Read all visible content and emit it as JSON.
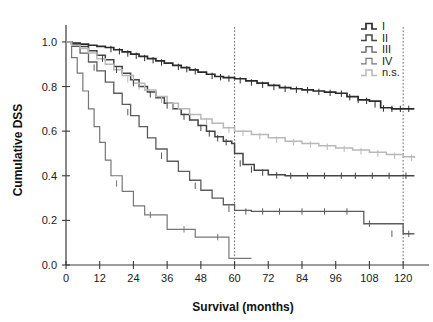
{
  "chart_data": {
    "type": "line",
    "title": "",
    "xlabel": "Survival (months)",
    "ylabel": "Cumulative DSS",
    "xlim": [
      0,
      126
    ],
    "ylim": [
      0.0,
      1.04
    ],
    "xticks": [
      0,
      12,
      24,
      36,
      48,
      60,
      72,
      84,
      96,
      108,
      120
    ],
    "xtick_labels": [
      "0",
      "12",
      "24",
      "36",
      "48",
      "60",
      "72",
      "84",
      "96",
      "108",
      "120"
    ],
    "yticks": [
      0.0,
      0.2,
      0.4,
      0.6,
      0.8,
      1.0
    ],
    "ytick_labels": [
      "0.0",
      "0.2",
      "0.4",
      "0.6",
      "0.8",
      "1.0"
    ],
    "grid": false,
    "legend_position": "top-right",
    "reference_lines": [
      {
        "name": "vline-60",
        "orientation": "vertical",
        "x": 60,
        "style": "dotted"
      },
      {
        "name": "vline-120",
        "orientation": "vertical",
        "x": 120,
        "style": "dotted"
      }
    ],
    "series": [
      {
        "name": "I",
        "label": "I",
        "color": "#2a2a2a",
        "width": 1.7,
        "final_value": 0.7,
        "x": [
          0,
          2,
          5,
          8,
          11,
          14,
          17,
          20,
          23,
          26,
          29,
          32,
          35,
          38,
          41,
          44,
          47,
          50,
          53,
          56,
          60,
          64,
          68,
          72,
          76,
          80,
          84,
          88,
          92,
          96,
          100,
          104,
          108,
          112,
          116,
          120,
          124
        ],
        "y": [
          1.0,
          0.995,
          0.99,
          0.985,
          0.98,
          0.975,
          0.965,
          0.955,
          0.945,
          0.935,
          0.925,
          0.915,
          0.905,
          0.895,
          0.885,
          0.875,
          0.865,
          0.855,
          0.845,
          0.84,
          0.835,
          0.825,
          0.815,
          0.805,
          0.795,
          0.79,
          0.785,
          0.78,
          0.775,
          0.77,
          0.755,
          0.74,
          0.735,
          0.705,
          0.7,
          0.7,
          0.7
        ],
        "censor_x": [
          16,
          19,
          22,
          25,
          28,
          31,
          34,
          40,
          43,
          46,
          52,
          55,
          58,
          62,
          66,
          70,
          74,
          78,
          82,
          86,
          90,
          94,
          98,
          101,
          104,
          107,
          110,
          113,
          116,
          119,
          122
        ],
        "censor_y": [
          0.968,
          0.958,
          0.948,
          0.938,
          0.928,
          0.918,
          0.908,
          0.888,
          0.878,
          0.868,
          0.848,
          0.842,
          0.836,
          0.828,
          0.818,
          0.808,
          0.798,
          0.79,
          0.786,
          0.784,
          0.776,
          0.772,
          0.768,
          0.752,
          0.74,
          0.736,
          0.72,
          0.702,
          0.7,
          0.7,
          0.7
        ]
      },
      {
        "name": "II",
        "label": "II",
        "color": "#444444",
        "width": 1.5,
        "final_value": 0.4,
        "x": [
          0,
          2,
          5,
          8,
          11,
          14,
          17,
          20,
          23,
          26,
          29,
          32,
          35,
          38,
          41,
          44,
          47,
          50,
          53,
          56,
          59,
          60,
          63,
          67,
          72,
          78,
          84,
          90,
          96,
          102,
          108,
          114,
          120,
          124
        ],
        "y": [
          1.0,
          0.99,
          0.98,
          0.96,
          0.94,
          0.92,
          0.89,
          0.86,
          0.83,
          0.8,
          0.775,
          0.75,
          0.725,
          0.7,
          0.675,
          0.65,
          0.625,
          0.6,
          0.575,
          0.555,
          0.545,
          0.5,
          0.45,
          0.425,
          0.405,
          0.4,
          0.4,
          0.4,
          0.4,
          0.4,
          0.4,
          0.4,
          0.4,
          0.4
        ],
        "censor_x": [
          13,
          18,
          24,
          30,
          36,
          42,
          48,
          51,
          54,
          57,
          62,
          66,
          70,
          75,
          80,
          86,
          92,
          98,
          103,
          109,
          115,
          121
        ],
        "censor_y": [
          0.925,
          0.875,
          0.815,
          0.765,
          0.715,
          0.665,
          0.615,
          0.59,
          0.568,
          0.551,
          0.455,
          0.428,
          0.414,
          0.402,
          0.4,
          0.4,
          0.4,
          0.4,
          0.4,
          0.4,
          0.4,
          0.4
        ]
      },
      {
        "name": "III",
        "label": "III",
        "color": "#5c5c5c",
        "width": 1.3,
        "final_value": 0.14,
        "x": [
          0,
          2,
          5,
          8,
          11,
          14,
          17,
          20,
          23,
          26,
          29,
          32,
          36,
          40,
          44,
          48,
          52,
          56,
          60,
          66,
          72,
          80,
          88,
          96,
          104,
          106,
          112,
          120,
          124
        ],
        "y": [
          1.0,
          0.98,
          0.95,
          0.91,
          0.87,
          0.82,
          0.77,
          0.72,
          0.67,
          0.62,
          0.57,
          0.52,
          0.465,
          0.42,
          0.38,
          0.335,
          0.3,
          0.27,
          0.245,
          0.24,
          0.24,
          0.24,
          0.24,
          0.24,
          0.24,
          0.185,
          0.185,
          0.14,
          0.14
        ],
        "censor_x": [
          10,
          22,
          34,
          46,
          58,
          64,
          70,
          76,
          84,
          92,
          100,
          108,
          116,
          122
        ],
        "censor_y": [
          0.885,
          0.685,
          0.49,
          0.355,
          0.252,
          0.24,
          0.24,
          0.24,
          0.24,
          0.24,
          0.24,
          0.185,
          0.14,
          0.14
        ]
      },
      {
        "name": "IV",
        "label": "IV",
        "color": "#777777",
        "width": 1.2,
        "final_value": 0.03,
        "x": [
          0,
          2,
          4,
          6,
          8,
          10,
          12,
          14,
          16,
          20,
          24,
          28,
          32,
          36,
          40,
          46,
          52,
          58,
          64,
          66
        ],
        "y": [
          1.0,
          0.93,
          0.86,
          0.78,
          0.7,
          0.62,
          0.55,
          0.47,
          0.4,
          0.33,
          0.265,
          0.225,
          0.225,
          0.16,
          0.16,
          0.125,
          0.125,
          0.03,
          0.03,
          0.03
        ],
        "censor_x": [
          18,
          30,
          42,
          54
        ],
        "censor_y": [
          0.365,
          0.225,
          0.16,
          0.125
        ]
      },
      {
        "name": "n.s.",
        "label": "n.s.",
        "color": "#b8b8b8",
        "width": 1.5,
        "final_value": 0.48,
        "x": [
          0,
          2,
          5,
          8,
          11,
          14,
          17,
          20,
          24,
          28,
          32,
          36,
          40,
          44,
          48,
          52,
          56,
          60,
          66,
          72,
          78,
          84,
          90,
          96,
          102,
          108,
          114,
          120,
          124
        ],
        "y": [
          1.0,
          0.985,
          0.97,
          0.95,
          0.925,
          0.9,
          0.875,
          0.85,
          0.815,
          0.785,
          0.755,
          0.725,
          0.7,
          0.675,
          0.655,
          0.635,
          0.615,
          0.6,
          0.585,
          0.57,
          0.555,
          0.545,
          0.535,
          0.525,
          0.515,
          0.505,
          0.495,
          0.485,
          0.48
        ],
        "censor_x": [
          22,
          26,
          34,
          38,
          50,
          58,
          63,
          69,
          75,
          81,
          87,
          93,
          99,
          105,
          111,
          117,
          123
        ],
        "censor_y": [
          0.832,
          0.8,
          0.74,
          0.712,
          0.645,
          0.607,
          0.592,
          0.577,
          0.562,
          0.55,
          0.54,
          0.53,
          0.52,
          0.51,
          0.5,
          0.49,
          0.48
        ]
      }
    ]
  },
  "legend": {
    "entries": [
      "I",
      "II",
      "III",
      "IV",
      "n.s."
    ]
  }
}
